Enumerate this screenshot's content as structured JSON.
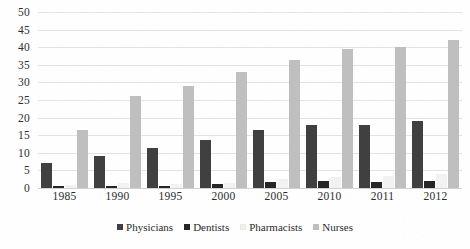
{
  "chart_data": {
    "type": "bar",
    "title": "",
    "subtitle": "",
    "xlabel": "",
    "ylabel": "",
    "categories": [
      "1985",
      "1990",
      "1995",
      "2000",
      "2005",
      "2010",
      "2011",
      "2012"
    ],
    "series": [
      {
        "name": "Physicians",
        "color": "#404040",
        "values": [
          7,
          9,
          11.5,
          13.5,
          16.5,
          18,
          18,
          19
        ]
      },
      {
        "name": "Dentists",
        "color": "#262626",
        "values": [
          0.5,
          0.5,
          0.6,
          1.2,
          1.8,
          2,
          1.8,
          2
        ]
      },
      {
        "name": "Pharmacists",
        "color": "#f2f2f2",
        "values": [
          0.8,
          1.5,
          1,
          1.5,
          2.5,
          3,
          3.5,
          4
        ]
      },
      {
        "name": "Nurses",
        "color": "#bfbfbf",
        "values": [
          16.5,
          26,
          29,
          33,
          36.5,
          39.5,
          40,
          42
        ]
      }
    ],
    "ylim": [
      0,
      50
    ],
    "ytick_step": 5,
    "yticks": [
      "50",
      "45",
      "40",
      "35",
      "30",
      "25",
      "20",
      "15",
      "10",
      "5",
      "0"
    ],
    "grid": true,
    "legend_position": "bottom-center"
  },
  "legend": {
    "items": [
      {
        "label": "Physicians"
      },
      {
        "label": "Dentists"
      },
      {
        "label": "Pharmacists"
      },
      {
        "label": "Nurses"
      }
    ]
  }
}
